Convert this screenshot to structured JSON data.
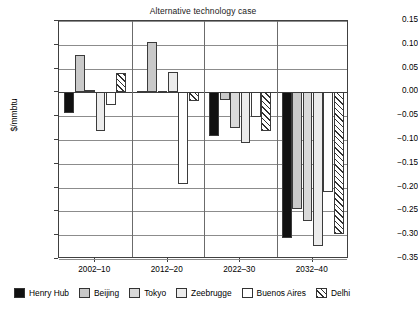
{
  "chart_data": {
    "type": "bar",
    "title": "Alternative technology case",
    "xlabel": "",
    "ylabel": "$/mmbtu",
    "ylim": [
      -0.35,
      0.15
    ],
    "yticks": [
      "0.15",
      "0.10",
      "0.05",
      "0.00",
      "-0.05",
      "-0.10",
      "-0.15",
      "-0.20",
      "-0.25",
      "-0.30",
      "-0.35"
    ],
    "ytick_values": [
      0.15,
      0.1,
      0.05,
      0.0,
      -0.05,
      -0.1,
      -0.15,
      -0.2,
      -0.25,
      -0.3,
      -0.35
    ],
    "grid": true,
    "legend_position": "bottom",
    "categories": [
      "2002–10",
      "2012–20",
      "2022–30",
      "2032–40"
    ],
    "series": [
      {
        "name": "Henry Hub",
        "key": "henryhub",
        "values": [
          -0.044,
          0.003,
          -0.091,
          -0.305
        ]
      },
      {
        "name": "Beijing",
        "key": "beijing",
        "values": [
          0.078,
          0.105,
          -0.016,
          -0.245
        ]
      },
      {
        "name": "Tokyo",
        "key": "tokyo",
        "values": [
          0.006,
          0.002,
          -0.074,
          -0.27
        ]
      },
      {
        "name": "Zeebrugge",
        "key": "zeebrugge",
        "values": [
          -0.082,
          0.042,
          -0.106,
          -0.322
        ]
      },
      {
        "name": "Buenos Aires",
        "key": "buenosaires",
        "values": [
          -0.027,
          -0.193,
          -0.051,
          -0.21
        ]
      },
      {
        "name": "Delhi",
        "key": "delhi",
        "values": [
          0.041,
          -0.019,
          -0.082,
          -0.297
        ]
      }
    ]
  },
  "legend": {
    "items": [
      {
        "label": "Henry Hub",
        "key": "henryhub"
      },
      {
        "label": "Beijing",
        "key": "beijing"
      },
      {
        "label": "Tokyo",
        "key": "tokyo"
      },
      {
        "label": "Zeebrugge",
        "key": "zeebrugge"
      },
      {
        "label": "Buenos Aires",
        "key": "buenosaires"
      },
      {
        "label": "Delhi",
        "key": "delhi"
      }
    ]
  },
  "colors": {
    "henryhub": "#111111",
    "beijing": "#c9c9c9",
    "tokyo": "#d9d9d9",
    "zeebrugge": "#ececec",
    "buenosaires": "#ffffff",
    "delhi": "#ffffff",
    "axis": "#404040",
    "grid": "#8c8c8c"
  }
}
